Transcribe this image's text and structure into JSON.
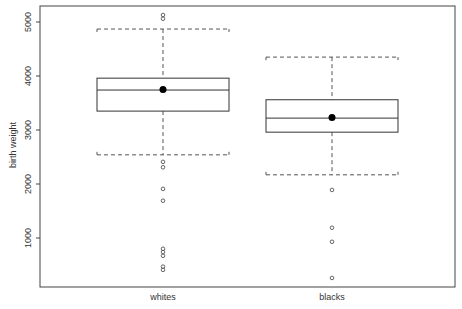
{
  "chart_data": {
    "type": "box",
    "title": "",
    "xlabel": "",
    "ylabel": "birth weight",
    "ylim": [
      0,
      5300
    ],
    "yticks": [
      1000,
      2000,
      3000,
      4000,
      5000
    ],
    "categories": [
      "whites",
      "blacks"
    ],
    "grid": false,
    "legend": null,
    "series": [
      {
        "name": "whites",
        "whisker_high": 4870,
        "q3": 3960,
        "median": 3740,
        "q1": 3350,
        "whisker_low": 2540,
        "mean": 3750,
        "outliers": [
          5130,
          5060,
          2410,
          2310,
          1910,
          1690,
          800,
          740,
          670,
          470,
          410
        ]
      },
      {
        "name": "blacks",
        "whisker_high": 4350,
        "q3": 3560,
        "median": 3220,
        "q1": 2960,
        "whisker_low": 2170,
        "mean": 3230,
        "outliers": [
          1890,
          1190,
          930,
          260
        ]
      }
    ]
  },
  "colors": {
    "frame": "#444444",
    "box": "#333333",
    "whisker": "#555555",
    "mean_dot": "#000000",
    "outlier": "#555555",
    "text": "#333333"
  }
}
